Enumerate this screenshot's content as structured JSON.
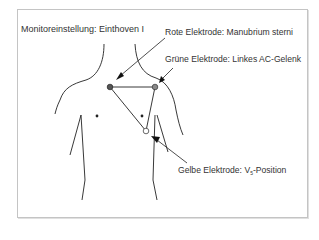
{
  "title": "Monitoreinstellung: Einthoven I",
  "labels": {
    "red": "Rote Elektrode: Manubrium sterni",
    "green": "Grüne Elektrode: Linkes AC-Gelenk",
    "yellow_prefix": "Gelbe Elektrode: V",
    "yellow_sub": "5",
    "yellow_suffix": "-Position"
  },
  "electrodes": [
    {
      "name": "red",
      "location": "Manubrium sterni",
      "fill": "#555555"
    },
    {
      "name": "green",
      "location": "Linkes AC-Gelenk",
      "fill": "#888888"
    },
    {
      "name": "yellow",
      "location": "V5-Position",
      "fill": "#ffffff"
    }
  ]
}
